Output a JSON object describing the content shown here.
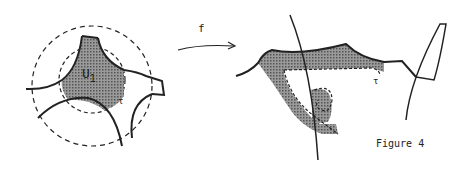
{
  "figure": {
    "caption": "Figure 4",
    "left_panel": {
      "region_label": "U",
      "region_subscript": "1",
      "boundary_label": "τ"
    },
    "map_label": "f",
    "right_panel": {
      "boundary_label": "τ"
    }
  }
}
